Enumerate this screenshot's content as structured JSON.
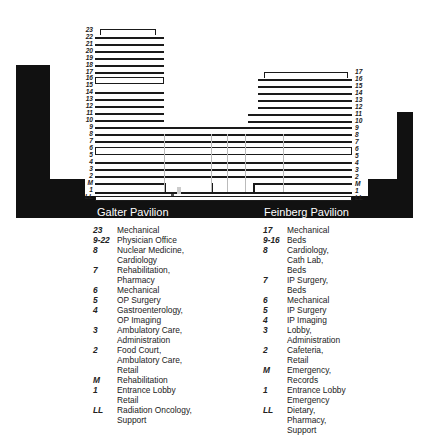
{
  "diagram": {
    "pavilions": [
      {
        "name": "Galter Pavilion"
      },
      {
        "name": "Feinberg Pavilion"
      }
    ],
    "left_floor_labels": [
      "23",
      "22",
      "21",
      "20",
      "19",
      "18",
      "17",
      "16",
      "15",
      "14",
      "13",
      "12",
      "11",
      "10",
      "9",
      "8",
      "7",
      "6",
      "5",
      "4",
      "3",
      "2",
      "M",
      "1",
      "LL"
    ],
    "right_floor_labels": [
      "17",
      "16",
      "15",
      "14",
      "13",
      "12",
      "11",
      "10",
      "9",
      "8",
      "7",
      "6",
      "5",
      "4",
      "3",
      "2",
      "M",
      "1",
      "LL"
    ]
  },
  "legend": {
    "galter": [
      {
        "floor": "23",
        "use": "Mechanical"
      },
      {
        "floor": "9-22",
        "use": "Physician Office"
      },
      {
        "floor": "8",
        "use": "Nuclear Medicine,\nCardiology"
      },
      {
        "floor": "7",
        "use": "Rehabilitation,\nPharmacy"
      },
      {
        "floor": "6",
        "use": "Mechanical"
      },
      {
        "floor": "5",
        "use": "OP Surgery"
      },
      {
        "floor": "4",
        "use": "Gastroenterology,\nOP Imaging"
      },
      {
        "floor": "3",
        "use": "Ambulatory Care,\nAdministration"
      },
      {
        "floor": "2",
        "use": "Food Court,\nAmbulatory Care,\nRetail"
      },
      {
        "floor": "M",
        "use": "Rehabilitation"
      },
      {
        "floor": "1",
        "use": "Entrance Lobby\nRetail"
      },
      {
        "floor": "LL",
        "use": "Radiation Oncology,\nSupport"
      }
    ],
    "feinberg": [
      {
        "floor": "17",
        "use": "Mechanical"
      },
      {
        "floor": "9-16",
        "use": "Beds"
      },
      {
        "floor": "8",
        "use": "Cardiology,\nCath Lab,\nBeds"
      },
      {
        "floor": "7",
        "use": "IP Surgery,\nBeds"
      },
      {
        "floor": "6",
        "use": "Mechanical"
      },
      {
        "floor": "5",
        "use": "IP Surgery"
      },
      {
        "floor": "4",
        "use": "IP Imaging"
      },
      {
        "floor": "3",
        "use": "Lobby,\nAdministration"
      },
      {
        "floor": "2",
        "use": "Cafeteria,\nRetail"
      },
      {
        "floor": "M",
        "use": "Emergency,\nRecords"
      },
      {
        "floor": "1",
        "use": "Entrance Lobby\nEmergency"
      },
      {
        "floor": "LL",
        "use": "Dietary,\nPharmacy,\nSupport"
      }
    ]
  }
}
